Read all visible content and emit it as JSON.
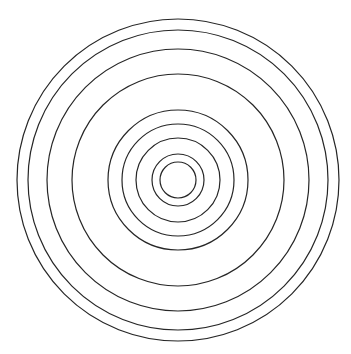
{
  "page": {
    "width": 351,
    "height": 354,
    "background_color": "#ffffff"
  },
  "artifacts": {
    "clipped_header_text": "·  ·",
    "clipped_header_color": "#b9b9c2"
  },
  "figure": {
    "name": "concentric-circles",
    "stroke_color": "#262626",
    "fill_color": "none",
    "stroke_width": 1.2,
    "center_x": 178,
    "center_y": 180,
    "circle_count": 9
  },
  "chart_data": {
    "type": "scatter",
    "title": "",
    "subtitle": "",
    "xlabel": "",
    "ylabel": "",
    "grid": false,
    "legend": null,
    "xlim": [
      0,
      351
    ],
    "ylim": [
      0,
      354
    ],
    "center": [
      178,
      180
    ],
    "series": [
      {
        "name": "concentric-circle-radii",
        "values": [
          161,
          150,
          131,
          106,
          70,
          56,
          42,
          26,
          18
        ]
      }
    ],
    "annotations": []
  }
}
